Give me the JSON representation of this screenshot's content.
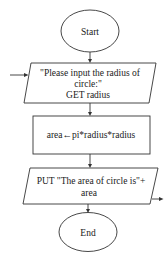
{
  "flowchart": {
    "start": {
      "label": "Start"
    },
    "input": {
      "line1": "\"Please input the radius of",
      "line2": "circle:\"",
      "line3": "GET radius"
    },
    "process": {
      "label": "area←pi*radius*radius"
    },
    "output": {
      "line1": "PUT \"The area of circle is\"+",
      "line2": "area"
    },
    "end": {
      "label": "End"
    }
  },
  "colors": {
    "stroke": "#333333",
    "background": "#ffffff",
    "text": "#1a1a1a"
  }
}
